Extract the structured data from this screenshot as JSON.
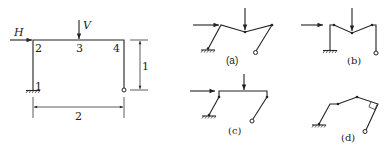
{
  "main_frame": {
    "loads": {
      "horizontal": "H",
      "vertical": "V"
    },
    "nodes": [
      "1",
      "2",
      "3",
      "4"
    ],
    "dimensions": {
      "height": "1",
      "width": "2"
    }
  },
  "mechanisms": [
    {
      "label": "(a)"
    },
    {
      "label": "(b)"
    },
    {
      "label": "(c)"
    },
    {
      "label": "(d)"
    }
  ],
  "colors": {
    "line": "#222222",
    "background": "#ffffff"
  }
}
